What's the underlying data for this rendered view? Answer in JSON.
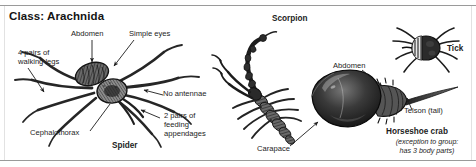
{
  "figure": {
    "title": "Class: Arachnida",
    "background": "#ffffff",
    "ink": "#1c1c1c"
  },
  "labels": {
    "abdomen_spider": "Abdomen",
    "simple_eyes": "Simple eyes",
    "walking_legs": "4 pairs of\nwalking legs",
    "no_antennae": "No antennae",
    "feeding_appendages": "2 pairs of\nfeeding\nappendages",
    "cephalothorax": "Cephalothorax",
    "spider_name": "Spider",
    "scorpion_name": "Scorpion",
    "carapace": "Carapace",
    "abdomen_crab": "Abdomen",
    "telson": "Telson (tail)",
    "tick_name": "Tick",
    "crab_name": "Horseshoe crab",
    "crab_note": "(exception to group:\nhas 3 body parts)"
  },
  "organisms": [
    {
      "name": "spider",
      "label": "Spider"
    },
    {
      "name": "scorpion",
      "label": "Scorpion"
    },
    {
      "name": "horseshoe-crab",
      "label": "Horseshoe crab"
    },
    {
      "name": "tick",
      "label": "Tick"
    }
  ]
}
